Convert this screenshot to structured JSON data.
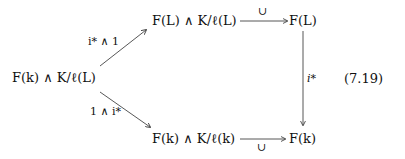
{
  "diagram": {
    "nodes": {
      "left": "F(k) ∧ K/ℓ(L)",
      "top_middle": "F(L) ∧ K/ℓ(L)",
      "top_right": "F(L)",
      "bottom_middle": "F(k) ∧ K/ℓ(k)",
      "bottom_right": "F(k)"
    },
    "arrows": {
      "left_to_top": "i* ∧ 1",
      "left_to_bottom": "1 ∧ i*",
      "top_horizontal": "∪",
      "bottom_horizontal": "∪",
      "right_vertical": "i*"
    },
    "equation_number": "(7.19)"
  }
}
